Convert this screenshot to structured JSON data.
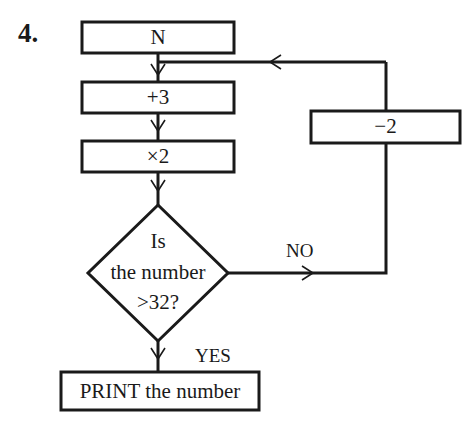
{
  "question_number": "4.",
  "flowchart": {
    "start_box": "N",
    "step1": "+3",
    "step2": "×2",
    "decision": {
      "line1": "Is",
      "line2": "the number",
      "line3": ">32?"
    },
    "no_label": "NO",
    "yes_label": "YES",
    "loop_box": "−2",
    "output_box": "PRINT the number"
  }
}
